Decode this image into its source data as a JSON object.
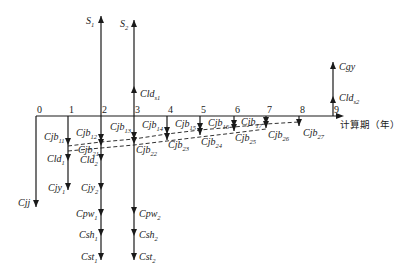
{
  "diagram": {
    "axis": {
      "label": "计算期（年）",
      "y": 116,
      "x_start": 36,
      "x_end": 336,
      "label_pos": [
        340,
        128
      ]
    },
    "ticks": [
      {
        "label": "0",
        "x": 36
      },
      {
        "label": "1",
        "x": 68
      },
      {
        "label": "2",
        "x": 101
      },
      {
        "label": "3",
        "x": 134
      },
      {
        "label": "4",
        "x": 167
      },
      {
        "label": "5",
        "x": 200
      },
      {
        "label": "6",
        "x": 234
      },
      {
        "label": "7",
        "x": 266
      },
      {
        "label": "8",
        "x": 299
      },
      {
        "label": "9",
        "x": 333
      }
    ],
    "up_arrows": [
      {
        "x": 101,
        "y1": 116,
        "y2": 16
      },
      {
        "x": 134,
        "y1": 116,
        "y2": 20
      },
      {
        "x": 134,
        "y1": 116,
        "y2": 86,
        "mid": true
      },
      {
        "x": 333,
        "y1": 116,
        "y2": 62
      },
      {
        "x": 333,
        "y1": 116,
        "y2": 96,
        "mid": true
      }
    ],
    "down_arrows": [
      {
        "x": 36,
        "y1": 116,
        "y2": 207
      },
      {
        "x": 68,
        "y1": 116,
        "y2": 190
      },
      {
        "x": 101,
        "y1": 116,
        "y2": 260
      },
      {
        "x": 134,
        "y1": 116,
        "y2": 260
      },
      {
        "x": 167,
        "y1": 116,
        "y2": 140
      },
      {
        "x": 200,
        "y1": 116,
        "y2": 135
      },
      {
        "x": 234,
        "y1": 116,
        "y2": 131
      },
      {
        "x": 266,
        "y1": 116,
        "y2": 128
      },
      {
        "x": 299,
        "y1": 116,
        "y2": 126
      }
    ],
    "arrowheads_down": [
      [
        68,
        145
      ],
      [
        68,
        161
      ],
      [
        101,
        141
      ],
      [
        101,
        146
      ],
      [
        101,
        161
      ],
      [
        101,
        190
      ],
      [
        101,
        216
      ],
      [
        101,
        236
      ],
      [
        101,
        260
      ],
      [
        134,
        139
      ],
      [
        134,
        144
      ],
      [
        134,
        214
      ],
      [
        134,
        236
      ],
      [
        134,
        260
      ],
      [
        167,
        134
      ],
      [
        167,
        140
      ],
      [
        200,
        130
      ],
      [
        200,
        135
      ],
      [
        234,
        127
      ],
      [
        234,
        131
      ],
      [
        266,
        124
      ],
      [
        266,
        128
      ],
      [
        299,
        126
      ],
      [
        68,
        190
      ],
      [
        36,
        207
      ]
    ],
    "arrowheads_up": [
      [
        101,
        16
      ],
      [
        134,
        20
      ],
      [
        134,
        86
      ],
      [
        333,
        62
      ],
      [
        333,
        96
      ]
    ],
    "dashed_lines": [
      {
        "points": [
          [
            68,
            146
          ],
          [
            101,
            142
          ],
          [
            134,
            139
          ],
          [
            167,
            134
          ],
          [
            200,
            130
          ],
          [
            234,
            127
          ],
          [
            266,
            124
          ],
          [
            299,
            122
          ]
        ]
      },
      {
        "points": [
          [
            68,
            151
          ],
          [
            101,
            148
          ],
          [
            134,
            145
          ],
          [
            167,
            141
          ],
          [
            200,
            137
          ],
          [
            234,
            133
          ],
          [
            266,
            129
          ]
        ]
      }
    ],
    "labels": [
      {
        "base": "S",
        "sub": "1",
        "x": 86,
        "y": 24
      },
      {
        "base": "S",
        "sub": "2",
        "x": 120,
        "y": 27
      },
      {
        "base": "Cld",
        "sub": "s1",
        "x": 140,
        "y": 97
      },
      {
        "base": "Cgy",
        "sub": "",
        "x": 339,
        "y": 70
      },
      {
        "base": "Cld",
        "sub": "s2",
        "x": 339,
        "y": 101
      },
      {
        "base": "Cjb",
        "sub": "11",
        "x": 44,
        "y": 140
      },
      {
        "base": "Cjb",
        "sub": "12",
        "x": 76,
        "y": 136
      },
      {
        "base": "Cjb",
        "sub": "13",
        "x": 110,
        "y": 130
      },
      {
        "base": "Cjb",
        "sub": "14",
        "x": 142,
        "y": 128
      },
      {
        "base": "Cjb",
        "sub": "15",
        "x": 175,
        "y": 127
      },
      {
        "base": "Cjb",
        "sub": "16",
        "x": 208,
        "y": 126
      },
      {
        "base": "Cjb",
        "sub": "17",
        "x": 241,
        "y": 125
      },
      {
        "base": "Cjb",
        "sub": "21",
        "x": 78,
        "y": 153
      },
      {
        "base": "Cjb",
        "sub": "22",
        "x": 136,
        "y": 153
      },
      {
        "base": "Cjb",
        "sub": "23",
        "x": 168,
        "y": 148
      },
      {
        "base": "Cjb",
        "sub": "24",
        "x": 201,
        "y": 145
      },
      {
        "base": "Cjb",
        "sub": "25",
        "x": 235,
        "y": 141
      },
      {
        "base": "Cjb",
        "sub": "26",
        "x": 268,
        "y": 138
      },
      {
        "base": "Cjb",
        "sub": "27",
        "x": 303,
        "y": 136
      },
      {
        "base": "Cld",
        "sub": "1",
        "x": 47,
        "y": 162
      },
      {
        "base": "Cld",
        "sub": "2",
        "x": 80,
        "y": 163
      },
      {
        "base": "Cjy",
        "sub": "1",
        "x": 48,
        "y": 191
      },
      {
        "base": "Cjy",
        "sub": "2",
        "x": 81,
        "y": 191
      },
      {
        "base": "Cjj",
        "sub": "",
        "x": 18,
        "y": 206
      },
      {
        "base": "Cpw",
        "sub": "1",
        "x": 76,
        "y": 217
      },
      {
        "base": "Cpw",
        "sub": "2",
        "x": 139,
        "y": 217
      },
      {
        "base": "Csh",
        "sub": "1",
        "x": 79,
        "y": 238
      },
      {
        "base": "Csh",
        "sub": "2",
        "x": 139,
        "y": 238
      },
      {
        "base": "Cst",
        "sub": "1",
        "x": 81,
        "y": 260
      },
      {
        "base": "Cst",
        "sub": "2",
        "x": 139,
        "y": 260
      }
    ],
    "colors": {
      "line": "#1a1a1a",
      "background": "#ffffff"
    }
  }
}
